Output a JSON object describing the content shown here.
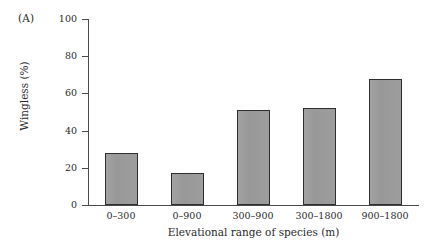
{
  "figure": {
    "panel_label": "(A)"
  },
  "chart_data": {
    "type": "bar",
    "title": "",
    "subtitle": "",
    "categories": [
      "0–300",
      "0–900",
      "300–900",
      "300–1800",
      "900–1800"
    ],
    "values": [
      28,
      17,
      51,
      52,
      68
    ],
    "xlabel": "Elevational range of species (m)",
    "ylabel": "Wingless (%)",
    "ylim": [
      0,
      100
    ],
    "yticks": [
      0,
      20,
      40,
      60,
      80,
      100
    ],
    "ytick_labels": [
      "0",
      "20",
      "40",
      "60",
      "80",
      "100"
    ],
    "grid": false,
    "legend": null,
    "series": [
      {
        "name": "Wingless species",
        "values": [
          28,
          17,
          51,
          52,
          68
        ]
      }
    ],
    "colors": {
      "bar_fill": "#9b9b9b",
      "bar_edge": "#2e2e2e",
      "axis": "#4a4a4a",
      "text": "#2a2a2a",
      "background": "#ffffff"
    }
  }
}
